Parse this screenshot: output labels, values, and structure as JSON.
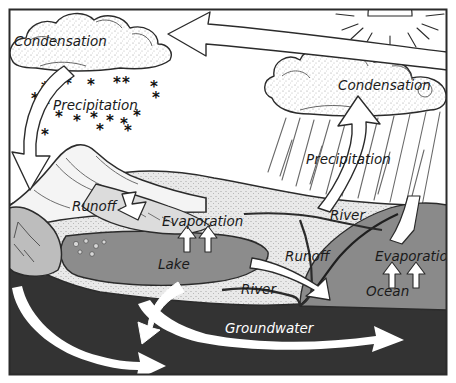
{
  "diagram": {
    "frame_color": "#2b2b2b",
    "background_color": "#ffffff",
    "palette": {
      "sky": "#ffffff",
      "cloud_fill": "#f2f2f2",
      "land_light": "#e8e8e8",
      "land_mid": "#d0d0d0",
      "mountain_shadow": "#b8b8b8",
      "water": "#8a8a8a",
      "lake": "#8c8c8c",
      "groundwater": "#3a3a3a",
      "bedrock": "#2f2f2f",
      "arrow_fill": "#ffffff",
      "ink": "#1a1a1a"
    },
    "labels": [
      {
        "id": "condensation-left",
        "text": "Condensation",
        "x": 14,
        "y": 42,
        "color": "dark"
      },
      {
        "id": "precipitation-left",
        "text": "Precipitation",
        "x": 53,
        "y": 106,
        "color": "dark"
      },
      {
        "id": "condensation-right",
        "text": "Condensation",
        "x": 338,
        "y": 86,
        "color": "dark"
      },
      {
        "id": "precipitation-right",
        "text": "Precipitation",
        "x": 306,
        "y": 160,
        "color": "dark"
      },
      {
        "id": "runoff-left",
        "text": "Runoff",
        "x": 72,
        "y": 207,
        "color": "dark"
      },
      {
        "id": "evaporation-lake",
        "text": "Evaporation",
        "x": 162,
        "y": 222,
        "color": "dark"
      },
      {
        "id": "lake",
        "text": "Lake",
        "x": 158,
        "y": 265,
        "color": "dark"
      },
      {
        "id": "river-upper",
        "text": "River",
        "x": 330,
        "y": 216,
        "color": "dark"
      },
      {
        "id": "runoff-right",
        "text": "Runoff",
        "x": 285,
        "y": 257,
        "color": "dark"
      },
      {
        "id": "evaporation-ocean",
        "text": "Evaporation",
        "x": 375,
        "y": 257,
        "color": "dark"
      },
      {
        "id": "river-lower",
        "text": "River",
        "x": 241,
        "y": 290,
        "color": "dark"
      },
      {
        "id": "ocean",
        "text": "Ocean",
        "x": 366,
        "y": 292,
        "color": "dark"
      },
      {
        "id": "groundwater",
        "text": "Groundwater",
        "x": 225,
        "y": 329,
        "color": "white"
      }
    ],
    "icons": {
      "sun": {
        "name": "sun-icon",
        "cx": 390,
        "cy": 12,
        "radius": 22,
        "ray_count": 9
      },
      "snowflakes": {
        "name": "snowflake-icon",
        "glyph": "*",
        "points": [
          [
            41,
            93
          ],
          [
            64,
            89
          ],
          [
            87,
            90
          ],
          [
            113,
            88
          ],
          [
            122,
            88
          ],
          [
            150,
            92
          ],
          [
            31,
            104
          ],
          [
            42,
            110
          ],
          [
            152,
            103
          ],
          [
            55,
            122
          ],
          [
            73,
            126
          ],
          [
            90,
            123
          ],
          [
            106,
            126
          ],
          [
            120,
            129
          ],
          [
            133,
            121
          ],
          [
            41,
            140
          ],
          [
            96,
            135
          ],
          [
            124,
            136
          ]
        ]
      },
      "evaporation_arrows_lake": [
        {
          "name": "up-arrow-icon",
          "x": 184,
          "y": 232
        },
        {
          "name": "up-arrow-icon",
          "x": 205,
          "y": 232
        }
      ],
      "evaporation_arrows_ocean": [
        {
          "name": "up-arrow-icon",
          "x": 390,
          "y": 266
        },
        {
          "name": "up-arrow-icon",
          "x": 414,
          "y": 266
        }
      ]
    },
    "flow_arrows": [
      {
        "name": "vapor-transport-arrow",
        "description": "large curved arrow across sky pointing left"
      },
      {
        "name": "condensation-to-mountain-arrow",
        "description": "curved arrow from left cloud down to mountain"
      },
      {
        "name": "ocean-to-cloud-arrow",
        "description": "curved arrow from ocean up into right cloud"
      },
      {
        "name": "runoff-arrow-left",
        "description": "short arrow on mountain slope pointing down-right"
      },
      {
        "name": "runoff-arrow-right",
        "description": "arrow across land pointing right into ocean"
      },
      {
        "name": "groundwater-arrow-main",
        "description": "wide arrow through groundwater to ocean"
      },
      {
        "name": "groundwater-arrow-lower",
        "description": "arrow curving down-right through bedrock"
      },
      {
        "name": "infiltration-arrow",
        "description": "arrow from lake bottom curving down"
      }
    ]
  }
}
